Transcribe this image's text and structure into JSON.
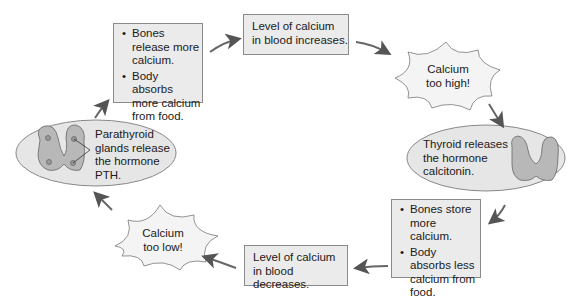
{
  "diagram": {
    "nodes": {
      "box_release": {
        "bullets": [
          "Bones release more calcium.",
          "Body absorbs more calcium from food."
        ]
      },
      "box_increase": {
        "line1": "Level of calcium",
        "line2": "in blood increases."
      },
      "burst_high": {
        "line1": "Calcium",
        "line2": "too high!"
      },
      "ellipse_thyroid": {
        "line1": "Thyroid releases",
        "line2": "the hormone",
        "line3": "calcitonin."
      },
      "box_store": {
        "bullets": [
          "Bones store more calcium.",
          "Body absorbs less calcium from food."
        ]
      },
      "box_decrease": {
        "line1": "Level of calcium",
        "line2": "in blood decreases."
      },
      "burst_low": {
        "line1": "Calcium",
        "line2": "too low!"
      },
      "ellipse_parathyroid": {
        "line1": "Parathyroid",
        "line2": "glands release",
        "line3": "the hormone",
        "line4": "PTH."
      }
    },
    "flow": [
      "box_release",
      "box_increase",
      "burst_high",
      "ellipse_thyroid",
      "box_store",
      "box_decrease",
      "burst_low",
      "ellipse_parathyroid",
      "box_release"
    ],
    "colors": {
      "fill": "#ebebeb",
      "stroke": "#8a8a8a",
      "arrow": "#666666",
      "gland": "#b5b5b5"
    }
  }
}
